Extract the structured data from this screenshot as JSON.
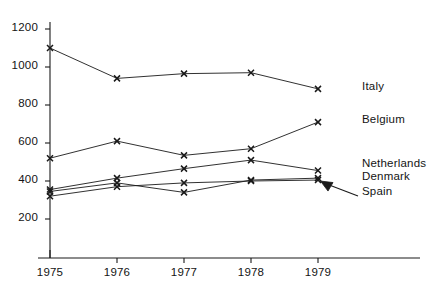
{
  "chart_data": {
    "type": "line",
    "title": "",
    "subtitle": "",
    "xlabel": "",
    "ylabel": "",
    "x": [
      1975,
      1976,
      1977,
      1978,
      1979
    ],
    "xtick_labels": [
      "1975",
      "1976",
      "1977",
      "1978",
      "1979"
    ],
    "ytick_labels": [
      "200",
      "400",
      "600",
      "800",
      "1000",
      "1200"
    ],
    "yticks": [
      200,
      400,
      600,
      800,
      1000,
      1200
    ],
    "ylim": [
      120,
      1270
    ],
    "xlim": [
      1974.78,
      1979.45
    ],
    "grid": false,
    "legend_position": "right-inline",
    "marker": "x",
    "line_color": "#1a1a1a",
    "series": [
      {
        "name": "Italy",
        "label": "Italy",
        "values": [
          1100,
          940,
          965,
          970,
          885
        ]
      },
      {
        "name": "Belgium",
        "label": "Belgium",
        "values": [
          520,
          610,
          535,
          570,
          710
        ]
      },
      {
        "name": "Netherlands",
        "label": "Netherlands",
        "values": [
          355,
          415,
          465,
          510,
          455
        ]
      },
      {
        "name": "Denmark",
        "label": "Denmark",
        "values": [
          345,
          390,
          340,
          405,
          415
        ]
      },
      {
        "name": "Spain",
        "label": "Spain",
        "values": [
          320,
          370,
          390,
          400,
          405
        ]
      }
    ],
    "annotations": [
      {
        "name": "spain-pointer",
        "text": "Spain",
        "target_series": "Spain",
        "target_x": 1979,
        "target_y": 405
      }
    ]
  }
}
